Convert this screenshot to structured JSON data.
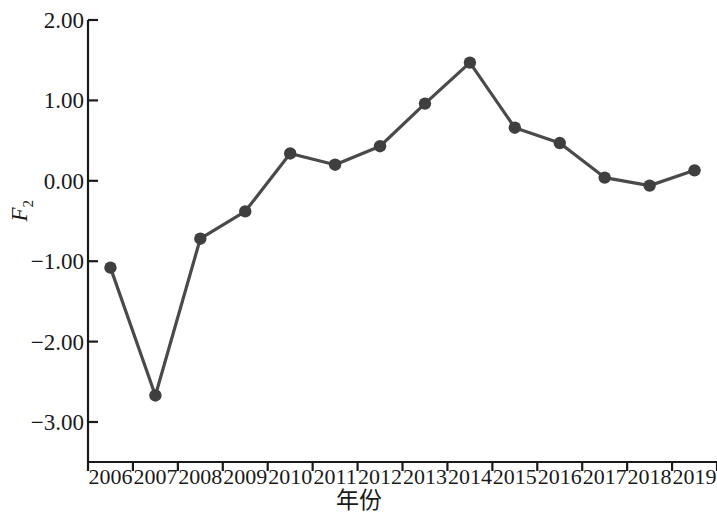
{
  "chart_data": {
    "type": "line",
    "title": "",
    "subtitle": "",
    "xlabel": "年份",
    "ylabel": "F",
    "ylabel_sub": "2",
    "categories": [
      "2006",
      "2007",
      "2008",
      "2009",
      "2010",
      "2011",
      "2012",
      "2013",
      "2014",
      "2015",
      "2016",
      "2017",
      "2018",
      "2019"
    ],
    "x": [
      2006,
      2007,
      2008,
      2009,
      2010,
      2011,
      2012,
      2013,
      2014,
      2015,
      2016,
      2017,
      2018,
      2019
    ],
    "values": [
      -1.08,
      -2.67,
      -0.72,
      -0.38,
      0.34,
      0.2,
      0.43,
      0.96,
      1.47,
      0.66,
      0.47,
      0.04,
      -0.06,
      0.13
    ],
    "series": [
      {
        "name": "F2",
        "values": [
          -1.08,
          -2.67,
          -0.72,
          -0.38,
          0.34,
          0.2,
          0.43,
          0.96,
          1.47,
          0.66,
          0.47,
          0.04,
          -0.06,
          0.13
        ]
      }
    ],
    "ylim": [
      -3.4,
      2.0
    ],
    "yticks": [
      2.0,
      1.0,
      0.0,
      -1.0,
      -2.0,
      -3.0
    ],
    "ytick_labels": [
      "2.00",
      "1.00",
      "0.00",
      "-1.00",
      "-2.00",
      "-3.00"
    ],
    "xtick_labels": [
      "2006",
      "2007",
      "2008",
      "2009",
      "2010",
      "2011",
      "2012",
      "2013",
      "2014",
      "2015",
      "2016",
      "2017",
      "2018",
      "2019"
    ],
    "grid": false,
    "legend": false,
    "legend_position": "none",
    "marker": "circle",
    "line_color": "#4a4a4a",
    "marker_color": "#3f3f3f",
    "axis_color": "#1a1a1a",
    "background_color": "#ffffff",
    "annotations": []
  }
}
